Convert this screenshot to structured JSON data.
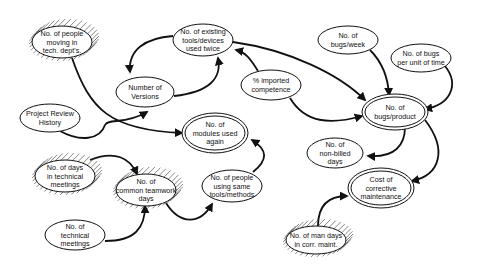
{
  "diagram": {
    "type": "influence-diagram",
    "legend_styles": {
      "plain": "single-outline ellipse",
      "goal": "double-outline ellipse",
      "hatched": "hatched-halo ellipse"
    },
    "nodes": [
      {
        "id": "people_moving",
        "lines": [
          "No. of people",
          "moving in",
          "tech. dept's."
        ],
        "style": "hatched",
        "cx": 62,
        "cy": 42,
        "rx": 30,
        "ry": 16
      },
      {
        "id": "existing_tools",
        "lines": [
          "No. of existing",
          "tools/devices",
          "used twice"
        ],
        "style": "plain",
        "cx": 203,
        "cy": 40,
        "rx": 30,
        "ry": 16
      },
      {
        "id": "bugs_week",
        "lines": [
          "No. of",
          "bugs/week"
        ],
        "style": "plain",
        "cx": 348,
        "cy": 40,
        "rx": 30,
        "ry": 14
      },
      {
        "id": "bugs_unit_time",
        "lines": [
          "No. of bugs",
          "per unit of time"
        ],
        "style": "plain",
        "cx": 421,
        "cy": 58,
        "rx": 30,
        "ry": 14
      },
      {
        "id": "versions",
        "lines": [
          "Number of",
          "Versions"
        ],
        "style": "plain",
        "cx": 145,
        "cy": 92,
        "rx": 29,
        "ry": 15
      },
      {
        "id": "imported_competence",
        "lines": [
          "% imported",
          "competence"
        ],
        "style": "plain",
        "cx": 271,
        "cy": 85,
        "rx": 30,
        "ry": 15
      },
      {
        "id": "project_review",
        "lines": [
          "Project Review",
          "History"
        ],
        "style": "plain",
        "cx": 50,
        "cy": 118,
        "rx": 30,
        "ry": 14
      },
      {
        "id": "bugs_product",
        "lines": [
          "No. of",
          "bugs/product"
        ],
        "style": "goal",
        "cx": 395,
        "cy": 112,
        "rx": 30,
        "ry": 15
      },
      {
        "id": "modules_reused",
        "lines": [
          "No. of",
          "modules used",
          "again"
        ],
        "style": "goal",
        "cx": 215,
        "cy": 133,
        "rx": 30,
        "ry": 17
      },
      {
        "id": "non_billed",
        "lines": [
          "No. of",
          "non-billed",
          "days"
        ],
        "style": "plain",
        "cx": 335,
        "cy": 153,
        "rx": 28,
        "ry": 15
      },
      {
        "id": "days_meetings",
        "lines": [
          "No. of days",
          "in technical",
          "meetings"
        ],
        "style": "hatched",
        "cx": 65,
        "cy": 176,
        "rx": 30,
        "ry": 16
      },
      {
        "id": "common_teamwork",
        "lines": [
          "No. of",
          "common teamwork",
          "days"
        ],
        "style": "hatched",
        "cx": 146,
        "cy": 190,
        "rx": 30,
        "ry": 16
      },
      {
        "id": "people_same_tools",
        "lines": [
          "No. of people",
          "using same",
          "tools/methods"
        ],
        "style": "plain",
        "cx": 232,
        "cy": 186,
        "rx": 30,
        "ry": 16
      },
      {
        "id": "corrective_cost",
        "lines": [
          "Cost of",
          "corrective",
          "maintenance"
        ],
        "style": "goal",
        "cx": 381,
        "cy": 188,
        "rx": 30,
        "ry": 17
      },
      {
        "id": "tech_meetings",
        "lines": [
          "No. of",
          "technical",
          "meetings"
        ],
        "style": "plain",
        "cx": 75,
        "cy": 235,
        "rx": 30,
        "ry": 15
      },
      {
        "id": "man_days",
        "lines": [
          "No. of man days",
          "in corr. maint."
        ],
        "style": "hatched",
        "cx": 316,
        "cy": 240,
        "rx": 30,
        "ry": 14
      }
    ],
    "edges": [
      {
        "from": "people_moving",
        "to": "modules_reused",
        "d": "M72,58 C90,110 110,130 182,133"
      },
      {
        "from": "existing_tools",
        "to": "versions",
        "d": "M173,36 C145,38 128,50 130,72"
      },
      {
        "from": "versions",
        "to": "existing_tools",
        "d": "M174,96 C210,92 222,78 218,58"
      },
      {
        "from": "project_review",
        "to": "versions",
        "d": "M60,131 C80,142 100,140 105,125 C108,118 125,125 147,112"
      },
      {
        "from": "imported_competence",
        "to": "existing_tools",
        "d": "M258,71 C250,58 245,52 236,50"
      },
      {
        "from": "existing_tools",
        "to": "bugs_product",
        "d": "M233,42 C290,50 340,75 365,100"
      },
      {
        "from": "imported_competence",
        "to": "bugs_product",
        "d": "M290,98 C305,123 330,125 362,116"
      },
      {
        "from": "bugs_week",
        "to": "bugs_product",
        "d": "M370,50 C382,62 388,76 389,95"
      },
      {
        "from": "bugs_unit_time",
        "to": "bugs_product",
        "d": "M445,66 C460,85 450,105 425,109"
      },
      {
        "from": "bugs_product",
        "to": "non_billed",
        "d": "M405,127 C405,145 395,158 368,156"
      },
      {
        "from": "bugs_product",
        "to": "corrective_cost",
        "d": "M425,120 C448,150 440,175 412,181"
      },
      {
        "from": "days_meetings",
        "to": "common_teamwork",
        "d": "M90,160 C115,150 130,158 137,174"
      },
      {
        "from": "tech_meetings",
        "to": "common_teamwork",
        "d": "M105,241 C135,241 145,228 145,206"
      },
      {
        "from": "common_teamwork",
        "to": "people_same_tools",
        "d": "M166,203 C180,225 200,225 212,204"
      },
      {
        "from": "people_same_tools",
        "to": "modules_reused",
        "d": "M253,172 C268,160 268,150 252,140"
      },
      {
        "from": "man_days",
        "to": "corrective_cost",
        "d": "M318,226 C318,205 328,196 347,196"
      }
    ]
  }
}
